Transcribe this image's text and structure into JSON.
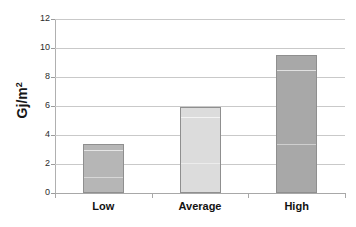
{
  "chart_data": {
    "type": "bar",
    "title": "",
    "xlabel": "",
    "ylabel": "Gj/m2",
    "ylabel_base": "Gj/m",
    "ylabel_sup": "2",
    "categories": [
      "Low",
      "Average",
      "High"
    ],
    "values": [
      3.4,
      5.9,
      9.5
    ],
    "yticks": [
      0,
      2,
      4,
      6,
      8,
      10,
      12
    ],
    "ytick_labels": [
      "0",
      "2",
      "4",
      "6",
      "8",
      "10",
      "12"
    ],
    "ylim": [
      0,
      12
    ],
    "grid": true,
    "legend": "none",
    "series": [
      {
        "name": "Energy intensity",
        "values": [
          3.4,
          5.9,
          9.5
        ]
      }
    ],
    "bar_colors": [
      "#b6b6b6",
      "#dcdcdc",
      "#a8a8a8"
    ],
    "bar_border_color": "#8f8f8f",
    "gridline_color": "#c9c9c9",
    "axis_color": "#a8a8a8",
    "background_color": "#ffffff",
    "text_color": "#121212"
  }
}
